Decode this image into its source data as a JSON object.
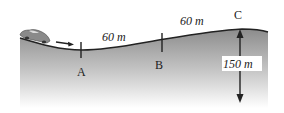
{
  "diagram": {
    "points": [
      {
        "id": "A",
        "label": "A"
      },
      {
        "id": "B",
        "label": "B"
      },
      {
        "id": "C",
        "label": "C"
      }
    ],
    "segments": [
      {
        "from": "A",
        "to": "B",
        "label": "60 m"
      },
      {
        "from": "B",
        "to": "C",
        "label": "60 m"
      }
    ],
    "height": {
      "at": "C",
      "label": "150 m"
    },
    "object": "car-moving-right",
    "colors": {
      "ground_top": "#8a8a8a",
      "ground_bottom": "#ffffff",
      "line": "#222222"
    }
  }
}
